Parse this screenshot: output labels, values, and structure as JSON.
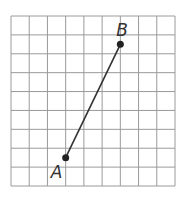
{
  "diagram": {
    "type": "grid-line-segment",
    "grid": {
      "columns": 9,
      "rows": 9,
      "line_color": "#9a9a9a"
    },
    "segment": {
      "color": "#333333"
    },
    "points": [
      {
        "label": "A",
        "col": 3,
        "row": 7.5
      },
      {
        "label": "B",
        "col": 6,
        "row": 1.5
      }
    ]
  }
}
